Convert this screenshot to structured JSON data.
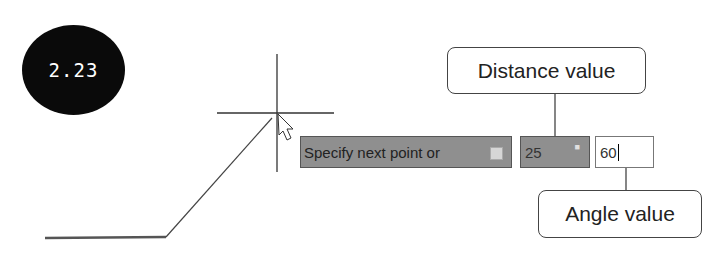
{
  "figure": {
    "number": "2.23"
  },
  "dynamic_input": {
    "prompt_text": "Specify next point or",
    "prompt_option_icon": "down-arrow-icon",
    "distance_value": "25",
    "distance_lock_icon": "lock-icon",
    "angle_value": "60"
  },
  "callouts": {
    "distance": "Distance value",
    "angle": "Angle value"
  },
  "colors": {
    "badge": "#0a0a0a",
    "input_bg": "#8f8f8f",
    "line": "#333333"
  }
}
